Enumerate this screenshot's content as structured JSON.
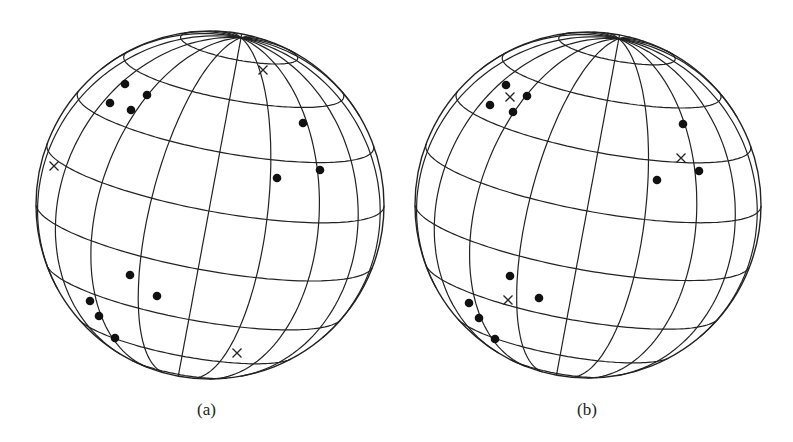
{
  "figure": {
    "stroke_color": "#222222",
    "background": "#ffffff",
    "grid": {
      "meridian_step_deg": 20,
      "parallel_step_deg": 20
    }
  },
  "panels": [
    {
      "id": "a",
      "caption": "(a)",
      "globe": {
        "cx": 210,
        "cy": 205,
        "r": 174,
        "tilt_deg": -10.5,
        "lean_deg": 12
      },
      "dots": [
        [
          125,
          84
        ],
        [
          147,
          95
        ],
        [
          110,
          103
        ],
        [
          131,
          110
        ],
        [
          303,
          123
        ],
        [
          277,
          178
        ],
        [
          320,
          170
        ],
        [
          130,
          275
        ],
        [
          157,
          296
        ],
        [
          90,
          301
        ],
        [
          99,
          316
        ],
        [
          115,
          338
        ]
      ],
      "crosses": [
        [
          263,
          70
        ],
        [
          54,
          166
        ],
        [
          237,
          353
        ]
      ]
    },
    {
      "id": "b",
      "caption": "(b)",
      "globe": {
        "cx": 588,
        "cy": 205,
        "r": 173,
        "tilt_deg": -10.5,
        "lean_deg": 12
      },
      "dots": [
        [
          506,
          85
        ],
        [
          527,
          96
        ],
        [
          490,
          105
        ],
        [
          513,
          112
        ],
        [
          683,
          124
        ],
        [
          657,
          180
        ],
        [
          699,
          171
        ],
        [
          510,
          276
        ],
        [
          539,
          298
        ],
        [
          469,
          303
        ],
        [
          479,
          318
        ],
        [
          495,
          339
        ]
      ],
      "crosses": [
        [
          510,
          97
        ],
        [
          681,
          158
        ],
        [
          508,
          300
        ]
      ]
    }
  ]
}
